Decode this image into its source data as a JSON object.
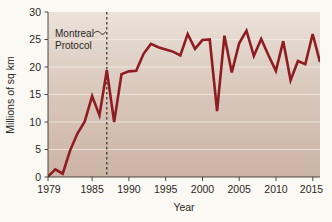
{
  "figure": {
    "background_color": "#fbf9f4",
    "plot_bg_top": "#e9dfd6",
    "plot_bg_bottom": "#cbb2a5",
    "line_color": "#8e1c20",
    "grid_color": "#f2e9e2",
    "axis_color": "#3a3330"
  },
  "chart_data": {
    "type": "line",
    "title": "",
    "subtitle": "",
    "xlabel": "Year",
    "ylabel": "Millions of sq km",
    "xlim": [
      1979,
      2016
    ],
    "ylim": [
      0,
      30
    ],
    "grid": true,
    "legend": "none",
    "x_ticks": [
      1979,
      1985,
      1990,
      1995,
      2000,
      2005,
      2010,
      2015
    ],
    "y_ticks": [
      0,
      5,
      10,
      15,
      20,
      25,
      30
    ],
    "x_tick_labels": [
      "1979",
      "1985",
      "1990",
      "1995",
      "2000",
      "2005",
      "2010",
      "2015"
    ],
    "y_tick_labels": [
      "0",
      "5",
      "10",
      "15",
      "20",
      "25",
      "30"
    ],
    "series": [
      {
        "name": "Antarctic ozone hole area",
        "color": "#8e1c20",
        "x": [
          1979,
          1980,
          1981,
          1982,
          1983,
          1984,
          1985,
          1986,
          1987,
          1988,
          1989,
          1990,
          1991,
          1992,
          1993,
          1994,
          1995,
          1996,
          1997,
          1998,
          1999,
          2000,
          2001,
          2002,
          2003,
          2004,
          2005,
          2006,
          2007,
          2008,
          2009,
          2010,
          2011,
          2012,
          2013,
          2014,
          2015,
          2016
        ],
        "values": [
          0.1,
          1.4,
          0.6,
          4.8,
          7.9,
          10.1,
          14.7,
          11.2,
          19.4,
          10.0,
          18.7,
          19.2,
          19.3,
          22.4,
          24.2,
          23.6,
          23.2,
          22.8,
          22.1,
          26.0,
          23.3,
          24.9,
          25.0,
          12.0,
          25.7,
          19.0,
          24.3,
          26.6,
          22.0,
          25.1,
          22.1,
          19.3,
          24.7,
          17.6,
          21.1,
          20.5,
          26.0,
          20.9
        ]
      }
    ],
    "annotations": [
      {
        "id": "montreal-protocol",
        "text_line1": "Montreal",
        "text_line2": "Protocol",
        "x_value": 1987,
        "type": "vertical-dashed-line-with-label"
      }
    ]
  }
}
